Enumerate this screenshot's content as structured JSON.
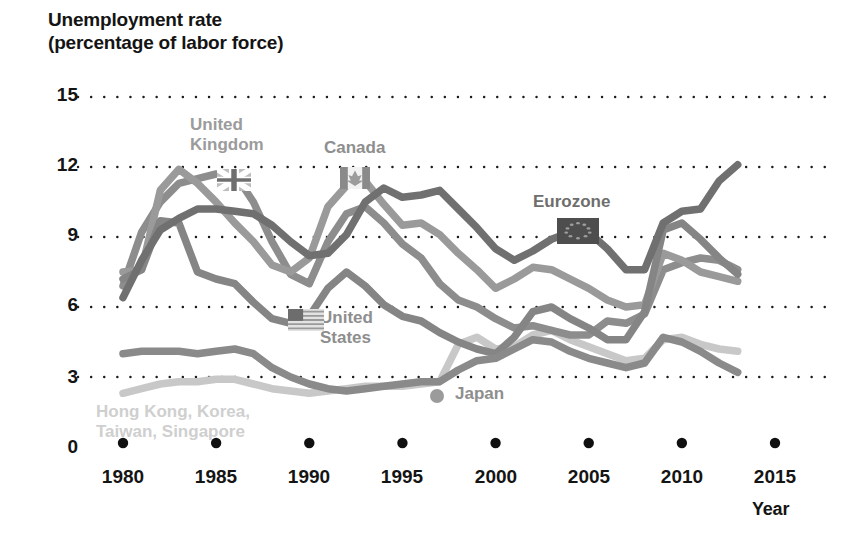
{
  "chart_data": {
    "type": "line",
    "ylabel": "Unemployment rate (percentage of labor force)",
    "xlabel": "Year",
    "xlim": [
      1980,
      2015
    ],
    "ylim": [
      0,
      15
    ],
    "y_ticks": [
      "0",
      "3",
      "6",
      "9",
      "12",
      "15"
    ],
    "x_ticks": [
      "1980",
      "1985",
      "1990",
      "1995",
      "2000",
      "2005",
      "2010",
      "2015"
    ],
    "grid": "horizontal dotted gridlines at 3, 6, 9, 12, 15",
    "legend": "inline labels on plot",
    "series": [
      {
        "name": "United Kingdom",
        "color": "#8d8d8d",
        "marker": "uk-flag",
        "x": [
          1980,
          1981,
          1982,
          1983,
          1984,
          1985,
          1986,
          1987,
          1988,
          1989,
          1990,
          1991,
          1992,
          1993,
          1994,
          1995,
          1996,
          1997,
          1998,
          1999,
          2000,
          2001,
          2002,
          2003,
          2004,
          2005,
          2006,
          2007,
          2008,
          2009,
          2010,
          2011,
          2012,
          2013
        ],
        "values": [
          6.9,
          9.2,
          10.5,
          11.3,
          11.5,
          11.7,
          11.7,
          10.5,
          8.8,
          7.4,
          7.0,
          8.8,
          10.0,
          10.3,
          9.6,
          8.7,
          8.1,
          7.0,
          6.3,
          6.0,
          5.5,
          5.1,
          5.2,
          5.0,
          4.8,
          4.8,
          5.4,
          5.3,
          5.7,
          7.6,
          7.9,
          8.1,
          8.0,
          7.6
        ]
      },
      {
        "name": "Canada",
        "color": "#9a9a9a",
        "marker": "canada-flag",
        "x": [
          1980,
          1981,
          1982,
          1983,
          1984,
          1985,
          1986,
          1987,
          1988,
          1989,
          1990,
          1991,
          1992,
          1993,
          1994,
          1995,
          1996,
          1997,
          1998,
          1999,
          2000,
          2001,
          2002,
          2003,
          2004,
          2005,
          2006,
          2007,
          2008,
          2009,
          2010,
          2011,
          2012,
          2013
        ],
        "values": [
          7.5,
          7.6,
          11.0,
          11.9,
          11.3,
          10.5,
          9.6,
          8.8,
          7.8,
          7.5,
          8.1,
          10.3,
          11.2,
          11.4,
          10.4,
          9.5,
          9.6,
          9.1,
          8.3,
          7.6,
          6.8,
          7.2,
          7.7,
          7.6,
          7.2,
          6.8,
          6.3,
          6.0,
          6.1,
          8.3,
          8.0,
          7.5,
          7.3,
          7.1
        ]
      },
      {
        "name": "Eurozone",
        "color": "#707070",
        "marker": "eu-flag",
        "x": [
          1980,
          1981,
          1982,
          1983,
          1984,
          1985,
          1986,
          1987,
          1988,
          1989,
          1990,
          1991,
          1992,
          1993,
          1994,
          1995,
          1996,
          1997,
          1998,
          1999,
          2000,
          2001,
          2002,
          2003,
          2004,
          2005,
          2006,
          2007,
          2008,
          2009,
          2010,
          2011,
          2012,
          2013
        ],
        "values": [
          6.4,
          8.0,
          9.3,
          9.8,
          10.2,
          10.2,
          10.1,
          10.0,
          9.5,
          8.8,
          8.2,
          8.3,
          9.1,
          10.5,
          11.1,
          10.7,
          10.8,
          11.0,
          10.2,
          9.4,
          8.5,
          8.0,
          8.4,
          8.9,
          9.2,
          9.2,
          8.5,
          7.6,
          7.6,
          9.6,
          10.1,
          10.2,
          11.4,
          12.1
        ]
      },
      {
        "name": "United States",
        "color": "#858585",
        "marker": "us-flag",
        "x": [
          1980,
          1981,
          1982,
          1983,
          1984,
          1985,
          1986,
          1987,
          1988,
          1989,
          1990,
          1991,
          1992,
          1993,
          1994,
          1995,
          1996,
          1997,
          1998,
          1999,
          2000,
          2001,
          2002,
          2003,
          2004,
          2005,
          2006,
          2007,
          2008,
          2009,
          2010,
          2011,
          2012,
          2013
        ],
        "values": [
          7.2,
          7.6,
          9.7,
          9.6,
          7.5,
          7.2,
          7.0,
          6.2,
          5.5,
          5.3,
          5.6,
          6.8,
          7.5,
          6.9,
          6.1,
          5.6,
          5.4,
          4.9,
          4.5,
          4.2,
          4.0,
          4.7,
          5.8,
          6.0,
          5.5,
          5.1,
          4.6,
          4.6,
          5.8,
          9.3,
          9.6,
          8.9,
          8.1,
          7.4
        ]
      },
      {
        "name": "Japan",
        "color": "#8a8a8a",
        "marker": "japan-dot",
        "x": [
          1980,
          1981,
          1982,
          1983,
          1984,
          1985,
          1986,
          1987,
          1988,
          1989,
          1990,
          1991,
          1992,
          1993,
          1994,
          1995,
          1996,
          1997,
          1998,
          1999,
          2000,
          2001,
          2002,
          2003,
          2004,
          2005,
          2006,
          2007,
          2008,
          2009,
          2010,
          2011,
          2012,
          2013
        ],
        "values": [
          4.0,
          4.1,
          4.1,
          4.1,
          4.0,
          4.1,
          4.2,
          4.0,
          3.4,
          3.0,
          2.7,
          2.5,
          2.4,
          2.5,
          2.6,
          2.7,
          2.8,
          2.8,
          3.3,
          3.7,
          3.8,
          4.2,
          4.6,
          4.5,
          4.1,
          3.8,
          3.6,
          3.4,
          3.6,
          4.7,
          4.5,
          4.1,
          3.6,
          3.2
        ]
      },
      {
        "name": "Hong Kong, Korea, Taiwan, Singapore",
        "color": "#c8c8c8",
        "marker": "none",
        "x": [
          1980,
          1981,
          1982,
          1983,
          1984,
          1985,
          1986,
          1987,
          1988,
          1989,
          1990,
          1991,
          1992,
          1993,
          1994,
          1995,
          1996,
          1997,
          1998,
          1999,
          2000,
          2001,
          2002,
          2003,
          2004,
          2005,
          2006,
          2007,
          2008,
          2009,
          2010,
          2011,
          2012,
          2013
        ],
        "values": [
          2.3,
          2.5,
          2.7,
          2.8,
          2.8,
          2.9,
          2.9,
          2.7,
          2.5,
          2.4,
          2.3,
          2.4,
          2.5,
          2.6,
          2.6,
          2.6,
          2.7,
          2.8,
          4.4,
          4.7,
          4.2,
          4.3,
          4.8,
          5.0,
          4.6,
          4.3,
          4.0,
          3.7,
          3.8,
          4.6,
          4.7,
          4.4,
          4.2,
          4.1
        ]
      }
    ],
    "annotations": [
      {
        "text": "United\nKingdom",
        "color": "#9b9b9b"
      },
      {
        "text": "Canada",
        "color": "#8e8e8e"
      },
      {
        "text": "Eurozone",
        "color": "#6e6e6e"
      },
      {
        "text": "United\nStates",
        "color": "#8e8e8e"
      },
      {
        "text": "Japan",
        "color": "#8e8e8e"
      },
      {
        "text": "Hong Kong, Korea,\nTaiwan, Singapore",
        "color": "#cfcfcf"
      }
    ]
  },
  "labels": {
    "y_axis_title": "Unemployment rate\n(percentage of labor force)",
    "x_axis_title": "Year",
    "uk": "United\nKingdom",
    "canada": "Canada",
    "eurozone": "Eurozone",
    "us": "United\nStates",
    "japan": "Japan",
    "tigers": "Hong Kong, Korea,\nTaiwan, Singapore",
    "y_ticks": [
      "15",
      "12",
      "9",
      "6",
      "3",
      "0"
    ],
    "x_ticks": [
      "1980",
      "1985",
      "1990",
      "1995",
      "2000",
      "2005",
      "2010",
      "2015"
    ]
  }
}
